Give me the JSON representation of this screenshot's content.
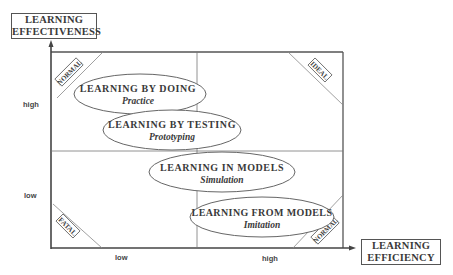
{
  "y_axis": {
    "title_line1": "LEARNING",
    "title_line2": "EFFECTIVENESS",
    "ticks": {
      "high": "high",
      "low": "low"
    }
  },
  "x_axis": {
    "title_line1": "LEARNING",
    "title_line2": "EFFICIENCY",
    "ticks": {
      "low": "low",
      "high": "high"
    }
  },
  "corners": {
    "top_left": "NORMAL",
    "top_right": "IDEAL",
    "bottom_left": "FATAL",
    "bottom_right": "NORMAL"
  },
  "ellipses": [
    {
      "title": "LEARNING BY DOING",
      "subtitle": "Practice"
    },
    {
      "title": "LEARNING BY TESTING",
      "subtitle": "Prototyping"
    },
    {
      "title": "LEARNING IN MODELS",
      "subtitle": "Simulation"
    },
    {
      "title": "LEARNING FROM MODELS",
      "subtitle": "Imitation"
    }
  ]
}
